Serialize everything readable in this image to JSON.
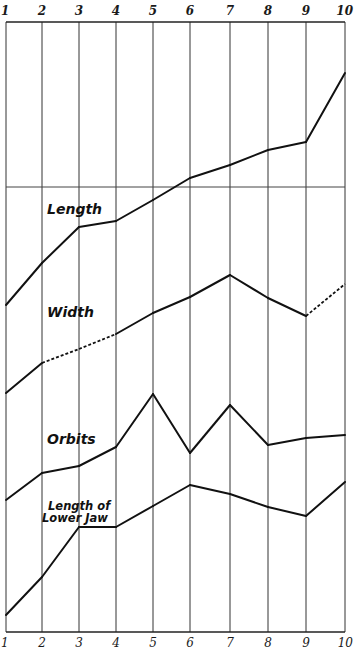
{
  "chart_data": {
    "type": "line",
    "title": "",
    "xlabel": "",
    "ylabel": "",
    "x": [
      1,
      2,
      3,
      4,
      5,
      6,
      7,
      8,
      9,
      10
    ],
    "top_tick_labels": [
      "1",
      "2",
      "3",
      "4",
      "5",
      "6",
      "7",
      "8",
      "9",
      "10"
    ],
    "bottom_tick_labels": [
      "1",
      "2",
      "3",
      "4",
      "5",
      "6",
      "7",
      "8",
      "9",
      "10"
    ],
    "grid": "vertical lines at each x; one horizontal reference line",
    "legend": "inline labels",
    "series": [
      {
        "name": "Length",
        "values_pixel_y": [
          305,
          263,
          227,
          221,
          200,
          178,
          165,
          150,
          142,
          73
        ],
        "dashed_segments": []
      },
      {
        "name": "Width",
        "values_pixel_y": [
          393,
          363,
          349,
          334,
          313,
          297,
          275,
          298,
          316,
          284
        ],
        "dashed_segments": [
          [
            2,
            4
          ],
          [
            9,
            10
          ]
        ]
      },
      {
        "name": "Orbits",
        "values_pixel_y": [
          500,
          473,
          466,
          447,
          394,
          453,
          405,
          445,
          438,
          435
        ],
        "dashed_segments": []
      },
      {
        "name": "Length of Lower Jaw",
        "values_pixel_y": [
          615,
          577,
          527,
          527,
          506,
          485,
          494,
          507,
          516,
          482
        ],
        "dashed_segments": []
      }
    ],
    "labels": {
      "length": "Length",
      "width": "Width",
      "orbits": "Orbits",
      "jaw_line1": "Length of",
      "jaw_line2": "Lower Jaw"
    }
  }
}
